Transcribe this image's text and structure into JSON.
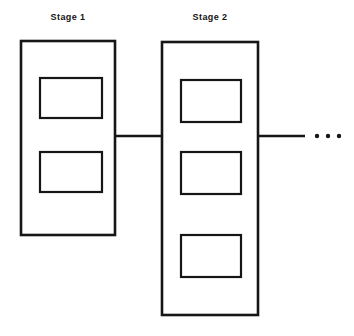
{
  "figure": {
    "background_color": "#ffffff",
    "line_color": "#161616",
    "fill_color": "#ffffff",
    "continuation_marker": "...",
    "continuation_dot_count": 3
  },
  "labels": {
    "stage1": "Stage 1",
    "stage2": "Stage 2"
  },
  "stages": [
    {
      "id": "stage-1",
      "label": "Stage 1",
      "outer": {
        "x": 21,
        "y": 41,
        "width": 94,
        "height": 194
      },
      "block_count": 2,
      "blocks": [
        {
          "index": 1,
          "x": 40,
          "y": 78,
          "width": 62,
          "height": 40
        },
        {
          "index": 2,
          "x": 40,
          "y": 152,
          "width": 62,
          "height": 40
        }
      ]
    },
    {
      "id": "stage-2",
      "label": "Stage 2",
      "outer": {
        "x": 162,
        "y": 42,
        "width": 96,
        "height": 273
      },
      "block_count": 3,
      "blocks": [
        {
          "index": 1,
          "x": 181,
          "y": 80,
          "width": 60,
          "height": 42
        },
        {
          "index": 2,
          "x": 181,
          "y": 152,
          "width": 60,
          "height": 42
        },
        {
          "index": 3,
          "x": 181,
          "y": 235,
          "width": 60,
          "height": 42
        }
      ]
    }
  ],
  "connectors": [
    {
      "id": "connector-stage1-stage2",
      "x1": 115,
      "y1": 136,
      "x2": 162,
      "y2": 136
    },
    {
      "id": "connector-stage2-next",
      "x1": 258,
      "y1": 136,
      "x2": 305,
      "y2": 136
    }
  ],
  "ellipsis": {
    "y": 136,
    "dots_x": [
      317,
      328,
      339
    ],
    "radius": 2.2
  }
}
